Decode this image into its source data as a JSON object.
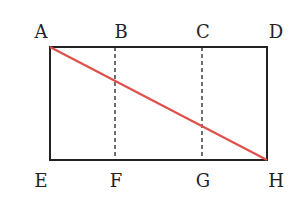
{
  "diagram": {
    "type": "geometry",
    "points": {
      "A": {
        "label": "A",
        "x": 50,
        "y": 47
      },
      "B": {
        "label": "B",
        "x": 115,
        "y": 47
      },
      "C": {
        "label": "C",
        "x": 202,
        "y": 47
      },
      "D": {
        "label": "D",
        "x": 267,
        "y": 47
      },
      "E": {
        "label": "E",
        "x": 50,
        "y": 160
      },
      "F": {
        "label": "F",
        "x": 115,
        "y": 160
      },
      "G": {
        "label": "G",
        "x": 202,
        "y": 160
      },
      "H": {
        "label": "H",
        "x": 267,
        "y": 160
      }
    },
    "segments": [
      {
        "from": "A",
        "to": "D",
        "style": "solid"
      },
      {
        "from": "E",
        "to": "H",
        "style": "solid"
      },
      {
        "from": "A",
        "to": "E",
        "style": "solid"
      },
      {
        "from": "D",
        "to": "H",
        "style": "solid"
      },
      {
        "from": "B",
        "to": "F",
        "style": "dashed"
      },
      {
        "from": "C",
        "to": "G",
        "style": "dashed"
      },
      {
        "from": "A",
        "to": "H",
        "style": "solid",
        "color": "#e0504a"
      }
    ],
    "colors": {
      "line": "#222222",
      "diagonal": "#e0504a"
    }
  }
}
